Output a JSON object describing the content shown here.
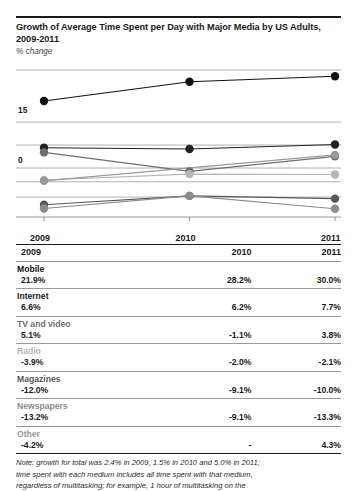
{
  "header": {
    "title": "Growth of Average Time Spent per Day with Major Media by US Adults, 2009-2011",
    "subtitle": "% change"
  },
  "chart_data": {
    "type": "line",
    "title": "Growth of Average Time Spent per Day with Major Media by US Adults, 2009-2011",
    "ylabel": "% change",
    "xlabel": "",
    "categories": [
      "2009",
      "2010",
      "2011"
    ],
    "yticks": [
      0,
      15
    ],
    "ytick_labels": [
      "0",
      "15"
    ],
    "ylim": [
      -16,
      33
    ],
    "grid": true,
    "legend": "none",
    "series": [
      {
        "name": "Mobile",
        "values": [
          21.9,
          28.2,
          30.0
        ],
        "color": "#111111"
      },
      {
        "name": "Internet",
        "values": [
          6.6,
          6.2,
          7.7
        ],
        "color": "#222222"
      },
      {
        "name": "TV and video",
        "values": [
          5.1,
          -1.1,
          3.8
        ],
        "color": "#6e6e6e"
      },
      {
        "name": "Radio",
        "values": [
          -3.9,
          -2.0,
          -2.1
        ],
        "color": "#b4b4b4"
      },
      {
        "name": "Magazines",
        "values": [
          -12.0,
          -9.1,
          -10.0
        ],
        "color": "#585858"
      },
      {
        "name": "Newspapers",
        "values": [
          -13.2,
          -9.1,
          -13.3
        ],
        "color": "#8c8c8c"
      },
      {
        "name": "Other",
        "values": [
          -4.2,
          null,
          4.3
        ],
        "color": "#999999"
      }
    ]
  },
  "table": {
    "year_headers": [
      "2009",
      "2010",
      "2011"
    ],
    "rows": [
      {
        "name": "Mobile",
        "values": [
          "21.9%",
          "28.2%",
          "30.0%"
        ],
        "name_color": "#111111"
      },
      {
        "name": "Internet",
        "values": [
          "6.6%",
          "6.2%",
          "7.7%"
        ],
        "name_color": "#222222"
      },
      {
        "name": "TV and video",
        "values": [
          "5.1%",
          "-1.1%",
          "3.8%"
        ],
        "name_color": "#6e6e6e"
      },
      {
        "name": "Radio",
        "values": [
          "-3.9%",
          "-2.0%",
          "-2.1%"
        ],
        "name_color": "#b4b4b4"
      },
      {
        "name": "Magazines",
        "values": [
          "-12.0%",
          "-9.1%",
          "-10.0%"
        ],
        "name_color": "#585858"
      },
      {
        "name": "Newspapers",
        "values": [
          "-13.2%",
          "-9.1%",
          "-13.3%"
        ],
        "name_color": "#8c8c8c"
      },
      {
        "name": "Other",
        "values": [
          "-4.2%",
          "-",
          "4.3%"
        ],
        "name_color": "#999999"
      }
    ]
  },
  "note": {
    "line1": "Note: growth for total was 2.4% in 2009, 1.5% in 2010 and 5.0% in 2011;",
    "line2": "time spent with each medium includes all time spent with that medium,",
    "line3": "regardless of multitasking; for example, 1 hour of multitasking on the"
  }
}
